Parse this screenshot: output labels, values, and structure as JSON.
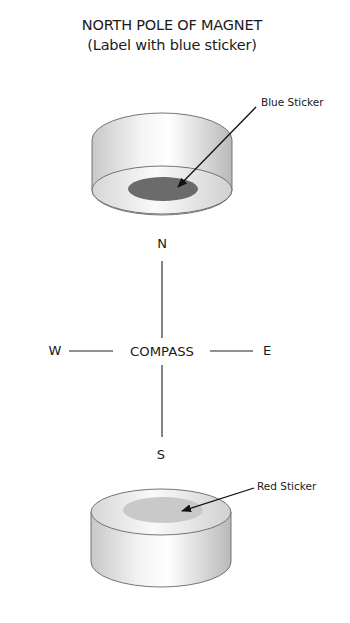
{
  "title": {
    "line1": "NORTH POLE OF MAGNET",
    "line2": "(Label with blue sticker)"
  },
  "top_magnet": {
    "callout": "Blue Sticker",
    "sticker_color": "#6b6b6b"
  },
  "compass": {
    "center_label": "COMPASS",
    "north": "N",
    "south": "S",
    "east": "E",
    "west": "W"
  },
  "bottom_magnet": {
    "callout": "Red Sticker",
    "sticker_color": "#c9c9c9"
  }
}
